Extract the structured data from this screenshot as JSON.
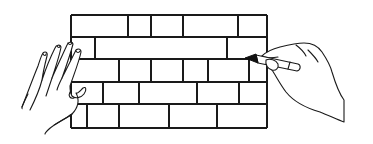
{
  "illustration": {
    "description": "Line drawing of a brick wall; a left hand rests flat on the wall while a right hand draws on it with a marker",
    "colors": {
      "background": "#ffffff",
      "line": "#1a1a1a",
      "marker_tip": "#111111"
    },
    "wall": {
      "left": 71,
      "right": 267,
      "row_lines_y": [
        15,
        37,
        59,
        82,
        104,
        128
      ],
      "rows": [
        {
          "y_top": 15,
          "y_bottom": 37,
          "joints_x": [
            128,
            151,
            183,
            238
          ]
        },
        {
          "y_top": 37,
          "y_bottom": 59,
          "joints_x": [
            95,
            227
          ]
        },
        {
          "y_top": 59,
          "y_bottom": 82,
          "joints_x": [
            119,
            151,
            183,
            208,
            249
          ]
        },
        {
          "y_top": 82,
          "y_bottom": 104,
          "joints_x": [
            103,
            139,
            197,
            239
          ]
        },
        {
          "y_top": 104,
          "y_bottom": 128,
          "joints_x": [
            87,
            119,
            169,
            217
          ]
        }
      ]
    },
    "left_hand": {
      "icon": "open-hand-icon",
      "pose": "palm flat against wall"
    },
    "right_hand": {
      "icon": "hand-holding-marker-icon",
      "pose": "drawing on wall"
    },
    "marker": {
      "icon": "marker-icon",
      "tip": [
        245,
        58
      ]
    }
  }
}
